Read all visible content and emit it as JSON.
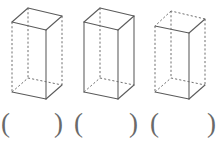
{
  "page": {
    "background_color": "#ffffff",
    "line_color": "#5a5a5a",
    "dash_color": "#6e6e6e"
  },
  "figure_row": {
    "label": "three-rectangular-prisms",
    "prisms": [
      {
        "id": "prism-1",
        "name": "rectangular-prism-left",
        "description": "tall rectangular prism, oblique projection, top face fully visible",
        "solid_edges_note": "top face outline, front vertical, bottom front-left and bottom front-right",
        "hidden_edges_note": "left vertical, right vertical, rear vertical, rear bottom edges"
      },
      {
        "id": "prism-2",
        "name": "rectangular-prism-middle",
        "description": "tall rectangular prism, oblique projection, front and side faces visible",
        "solid_edges_note": "top face outline, three visible verticals, bottom front-left and bottom front-right",
        "hidden_edges_note": "rear vertical, rear bottom-left and rear bottom-right edges"
      },
      {
        "id": "prism-3",
        "name": "rectangular-prism-right",
        "description": "tall rectangular prism, oblique projection, most edges hidden",
        "solid_edges_note": "top right edge, front vertical, bottom front-left and bottom front-right",
        "hidden_edges_note": "left vertical, right vertical, top front edges, rear bottom edges"
      }
    ]
  },
  "answer_row": {
    "label": "answer-blanks",
    "blanks": [
      {
        "id": "blank-1",
        "open": "(",
        "close": ")",
        "value": ""
      },
      {
        "id": "blank-2",
        "open": "(",
        "close": ")",
        "value": ""
      },
      {
        "id": "blank-3",
        "open": "(",
        "close": ")",
        "value": ""
      }
    ]
  }
}
